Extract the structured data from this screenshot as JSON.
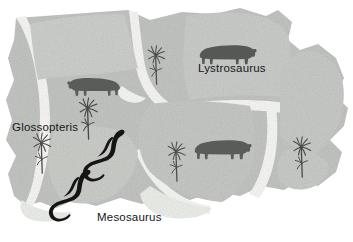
{
  "figure": {
    "name": "pangaea-fossil-evidence-map",
    "background_color": "#ffffff"
  },
  "colors": {
    "landmass_fill": "#c3c5c2",
    "landmass_fill_light": "#d3d5d2",
    "landmass_fill_dark": "#b6b8b5",
    "separation_channel": "#f4f5f3",
    "fossil_animal_fill": "#5a5c5a",
    "fossil_animal_dark": "#1b1b1b",
    "plant_fill": "#4a4c4a",
    "label_text": "#16161a"
  },
  "labels": [
    {
      "id": "lystrosaurus",
      "text": "Lystrosaurus",
      "x": 198,
      "y": 63
    },
    {
      "id": "glossopteris",
      "text": "Glossopteris",
      "x": 12,
      "y": 122
    },
    {
      "id": "mesosaurus",
      "text": "Mesosaurus",
      "x": 97,
      "y": 212
    }
  ],
  "fossil_markers": {
    "lystrosaurus": [
      {
        "x": 63,
        "y": 75,
        "facing": "left"
      },
      {
        "x": 198,
        "y": 42,
        "facing": "right"
      },
      {
        "x": 193,
        "y": 137,
        "facing": "right"
      }
    ],
    "glossopteris": [
      {
        "x": 143,
        "y": 44
      },
      {
        "x": 74,
        "y": 96
      },
      {
        "x": 28,
        "y": 131
      },
      {
        "x": 163,
        "y": 140
      },
      {
        "x": 288,
        "y": 135
      }
    ],
    "mesosaurus": [
      {
        "x": 82,
        "y": 128
      },
      {
        "x": 48,
        "y": 168
      }
    ]
  },
  "legend_note": {
    "icon_names": [
      "lystrosaurus-icon",
      "glossopteris-icon",
      "mesosaurus-icon"
    ]
  }
}
